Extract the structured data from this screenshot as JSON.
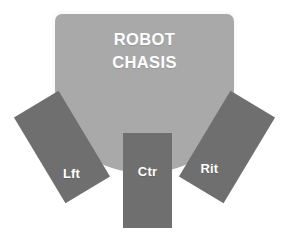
{
  "diagram": {
    "background_color": "#ffffff"
  },
  "chassis": {
    "label_line_1": "ROBOT",
    "label_line_2": "CHASIS",
    "fill_color": "#a9a9a9",
    "border_color": "#fbfbfb",
    "text_color": "#ffffff"
  },
  "sensors": [
    {
      "id": "left",
      "label": "Lft",
      "fill_color": "#6f6f6f",
      "text_color": "#ffffff",
      "rotation_deg": -31
    },
    {
      "id": "center",
      "label": "Ctr",
      "fill_color": "#6f6f6f",
      "text_color": "#ffffff",
      "rotation_deg": 0
    },
    {
      "id": "right",
      "label": "Rit",
      "fill_color": "#6f6f6f",
      "text_color": "#ffffff",
      "rotation_deg": 31
    }
  ]
}
